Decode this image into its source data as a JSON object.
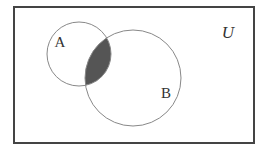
{
  "diagram": {
    "type": "venn",
    "universe": {
      "label": "U",
      "x": 14,
      "y": 7,
      "width": 240,
      "height": 136,
      "stroke": "#444444"
    },
    "sets": [
      {
        "label": "A",
        "cx": 79,
        "cy": 54,
        "r": 32,
        "label_x": 60,
        "label_y": 47
      },
      {
        "label": "B",
        "cx": 133,
        "cy": 78,
        "r": 48,
        "label_x": 166,
        "label_y": 98
      }
    ],
    "shaded_region": "A ∩ B",
    "colors": {
      "background": "#ffffff",
      "circle_stroke": "#888888",
      "shade_fill": "#555555",
      "text": "#333333"
    }
  }
}
